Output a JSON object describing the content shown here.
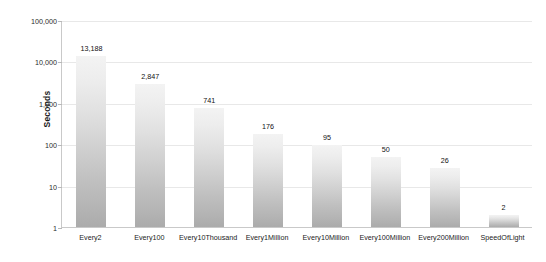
{
  "chart_data": {
    "type": "bar",
    "title": "",
    "xlabel": "",
    "ylabel": "Seconds",
    "scale": "log",
    "grid": true,
    "legend": "none",
    "ylim": [
      1,
      100000
    ],
    "ytick_labels": [
      "100,000",
      "10,000",
      "1,000",
      "100",
      "10",
      "1"
    ],
    "ytick_values": [
      100000,
      10000,
      1000,
      100,
      10,
      1
    ],
    "categories": [
      "Every2",
      "Every100",
      "Every10Thousand",
      "Every1Million",
      "Every10Million",
      "Every100Million",
      "Every200Million",
      "SpeedOfLight"
    ],
    "values": [
      13188,
      2847,
      741,
      176,
      95,
      50,
      26,
      2
    ],
    "value_labels": [
      "13,188",
      "2,847",
      "741",
      "176",
      "95",
      "50",
      "26",
      "2"
    ],
    "colors": {
      "bar_top": "#f3f3f3",
      "bar_bottom": "#ababab",
      "gridline": "#e8e8e8",
      "axis": "#c9c9c9",
      "background": "#ffffff",
      "text": "#1a1a1a"
    }
  }
}
